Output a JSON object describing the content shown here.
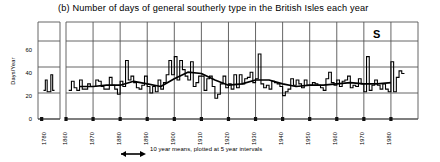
{
  "chart_data": {
    "type": "line",
    "title": "(b) Number of days of general southerly type in the British Isles each year",
    "panel_letter": "(b)",
    "series_label": "S",
    "xlabel": "",
    "ylabel": "Days/Year",
    "ylim": [
      0,
      70
    ],
    "yticks": [
      0,
      20,
      40,
      60
    ],
    "ytick_labels": [
      "0",
      "20",
      "40",
      "60"
    ],
    "xticks": [
      1780,
      1860,
      1870,
      1880,
      1890,
      1900,
      1910,
      1920,
      1930,
      1940,
      1950,
      1960,
      1970,
      1980
    ],
    "xtick_labels": [
      "1780",
      "1860",
      "1870",
      "1880",
      "1890",
      "1900",
      "1910",
      "1920",
      "1930",
      "1940",
      "1950",
      "1960",
      "1970",
      "1980"
    ],
    "grid": true,
    "axis_break": true,
    "axis_break_note": "Gap between isolated 1781-1786 segment and main 1861-1984 record",
    "legend_position": "none",
    "caption": "10 year means, plotted at 5 year intervals",
    "caption_marker": "arrow-line",
    "series": [
      {
        "name": "Annual count of southerly type days",
        "style": "step",
        "x_start": 1781,
        "segment_early_x": [
          1781,
          1782,
          1783,
          1784,
          1785,
          1786
        ],
        "segment_early_values": [
          22,
          30,
          21,
          21,
          34,
          22
        ],
        "x": [
          1861,
          1862,
          1863,
          1864,
          1865,
          1866,
          1867,
          1868,
          1869,
          1870,
          1871,
          1872,
          1873,
          1874,
          1875,
          1876,
          1877,
          1878,
          1879,
          1880,
          1881,
          1882,
          1883,
          1884,
          1885,
          1886,
          1887,
          1888,
          1889,
          1890,
          1891,
          1892,
          1893,
          1894,
          1895,
          1896,
          1897,
          1898,
          1899,
          1900,
          1901,
          1902,
          1903,
          1904,
          1905,
          1906,
          1907,
          1908,
          1909,
          1910,
          1911,
          1912,
          1913,
          1914,
          1915,
          1916,
          1917,
          1918,
          1919,
          1920,
          1921,
          1922,
          1923,
          1924,
          1925,
          1926,
          1927,
          1928,
          1929,
          1930,
          1931,
          1932,
          1933,
          1934,
          1935,
          1936,
          1937,
          1938,
          1939,
          1940,
          1941,
          1942,
          1943,
          1944,
          1945,
          1946,
          1947,
          1948,
          1949,
          1950,
          1951,
          1952,
          1953,
          1954,
          1955,
          1956,
          1957,
          1958,
          1959,
          1960,
          1961,
          1962,
          1963,
          1964,
          1965,
          1966,
          1967,
          1968,
          1969,
          1970,
          1971,
          1972,
          1973,
          1974,
          1975,
          1976,
          1977,
          1978,
          1979,
          1980,
          1981,
          1982,
          1983,
          1984
        ],
        "values": [
          22,
          29,
          24,
          22,
          30,
          23,
          23,
          27,
          25,
          25,
          30,
          29,
          25,
          23,
          23,
          32,
          26,
          23,
          19,
          29,
          25,
          45,
          30,
          33,
          28,
          24,
          23,
          26,
          33,
          25,
          20,
          25,
          21,
          30,
          23,
          28,
          34,
          45,
          34,
          48,
          30,
          45,
          38,
          33,
          30,
          44,
          25,
          28,
          33,
          33,
          22,
          31,
          33,
          25,
          16,
          19,
          27,
          33,
          24,
          27,
          23,
          34,
          24,
          34,
          27,
          31,
          32,
          36,
          28,
          31,
          50,
          27,
          24,
          26,
          23,
          29,
          28,
          27,
          25,
          18,
          21,
          23,
          31,
          26,
          30,
          27,
          24,
          30,
          26,
          26,
          28,
          27,
          26,
          24,
          22,
          31,
          36,
          28,
          26,
          30,
          25,
          29,
          30,
          33,
          24,
          26,
          25,
          31,
          27,
          21,
          48,
          22,
          26,
          30,
          26,
          23,
          27,
          23,
          21,
          44,
          21,
          32,
          37,
          35
        ]
      },
      {
        "name": "10 year means, plotted at 5 year intervals",
        "style": "smooth",
        "x": [
          1865,
          1870,
          1875,
          1880,
          1885,
          1890,
          1895,
          1900,
          1905,
          1910,
          1915,
          1920,
          1925,
          1930,
          1935,
          1940,
          1945,
          1950,
          1955,
          1960,
          1965,
          1970,
          1975,
          1980
        ],
        "values": [
          25,
          25,
          26,
          26,
          29,
          27,
          25,
          31,
          36,
          35,
          30,
          26,
          27,
          30,
          30,
          27,
          25,
          26,
          26,
          27,
          28,
          27,
          27,
          28
        ]
      }
    ]
  }
}
